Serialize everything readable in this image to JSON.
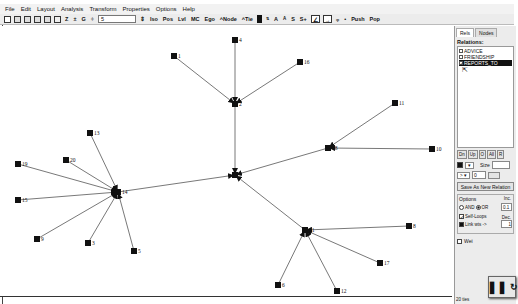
{
  "menubar": {
    "items": [
      "File",
      "Edit",
      "Layout",
      "Analysis",
      "Transform",
      "Properties",
      "Options",
      "Help"
    ]
  },
  "toolbar": {
    "spin_value": "5",
    "buttons": [
      "Iso",
      "Pos",
      "Lvl",
      "MC",
      "Ego",
      "^Node",
      "^Tie",
      "A",
      "A",
      "S",
      "S+",
      "Push",
      "Pop"
    ],
    "icons": [
      "new-file-icon",
      "open-icon",
      "save-icon",
      "save-as-icon",
      "grid-icon",
      "graph-icon",
      "z-icon",
      "t-icon",
      "g-icon",
      "filter-icon"
    ]
  },
  "panel": {
    "tabs": [
      "Rels",
      "Nodes"
    ],
    "relations_label": "Relations:",
    "relations": [
      {
        "label": "ADVICE",
        "checked": false,
        "selected": false
      },
      {
        "label": "FRIENDSHIP",
        "checked": false,
        "selected": false
      },
      {
        "label": "REPORTS_TO",
        "checked": true,
        "selected": true
      }
    ],
    "rel_buttons": [
      "Dn",
      "Up",
      "O",
      "All",
      "R"
    ],
    "size_label": "Size",
    "size_value": "",
    "line_value": "0",
    "save_button": "Save As New Relation",
    "options_label": "Options",
    "and_label": "AND",
    "or_label": "OR",
    "inc_label": "Inc.",
    "inc_value": "0.1",
    "self_loops_label": "Self-Loops",
    "link_wts_label": "Link wts ->",
    "dec_label": "Dec.",
    "dec_value": "1",
    "weights_label": "Wei",
    "status": "20 ties"
  },
  "graph": {
    "nodes": [
      {
        "id": "1",
        "x": 173,
        "y": 30
      },
      {
        "id": "4",
        "x": 234,
        "y": 14
      },
      {
        "id": "16",
        "x": 299,
        "y": 36
      },
      {
        "id": "2",
        "x": 234,
        "y": 78
      },
      {
        "id": "11",
        "x": 394,
        "y": 77
      },
      {
        "id": "18",
        "x": 327,
        "y": 122
      },
      {
        "id": "10",
        "x": 431,
        "y": 123
      },
      {
        "id": "7",
        "x": 234,
        "y": 149
      },
      {
        "id": "13",
        "x": 89,
        "y": 107
      },
      {
        "id": "20",
        "x": 65,
        "y": 134
      },
      {
        "id": "19",
        "x": 17,
        "y": 138
      },
      {
        "id": "14",
        "x": 117,
        "y": 166
      },
      {
        "id": "15",
        "x": 17,
        "y": 174
      },
      {
        "id": "9",
        "x": 36,
        "y": 213
      },
      {
        "id": "3",
        "x": 87,
        "y": 217
      },
      {
        "id": "5",
        "x": 133,
        "y": 225
      },
      {
        "id": "21",
        "x": 304,
        "y": 204
      },
      {
        "id": "8",
        "x": 408,
        "y": 200
      },
      {
        "id": "17",
        "x": 379,
        "y": 237
      },
      {
        "id": "6",
        "x": 277,
        "y": 259
      },
      {
        "id": "12",
        "x": 336,
        "y": 265
      }
    ],
    "edges": [
      [
        "1",
        "2"
      ],
      [
        "4",
        "2"
      ],
      [
        "16",
        "2"
      ],
      [
        "2",
        "7"
      ],
      [
        "18",
        "7"
      ],
      [
        "11",
        "18"
      ],
      [
        "10",
        "18"
      ],
      [
        "14",
        "7"
      ],
      [
        "13",
        "14"
      ],
      [
        "20",
        "14"
      ],
      [
        "19",
        "14"
      ],
      [
        "15",
        "14"
      ],
      [
        "9",
        "14"
      ],
      [
        "3",
        "14"
      ],
      [
        "5",
        "14"
      ],
      [
        "21",
        "7"
      ],
      [
        "8",
        "21"
      ],
      [
        "17",
        "21"
      ],
      [
        "6",
        "21"
      ],
      [
        "12",
        "21"
      ]
    ]
  }
}
